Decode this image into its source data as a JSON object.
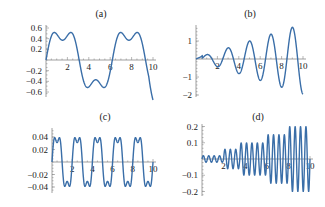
{
  "chart_data": [
    {
      "type": "line",
      "title": "(a)",
      "xlabel": "",
      "ylabel": "",
      "xlim": [
        0,
        10
      ],
      "ylim": [
        -0.7,
        0.7
      ],
      "xticks": [
        2,
        4,
        6,
        8,
        10
      ],
      "yticks": [
        0.6,
        0.4,
        0.2,
        -0.2,
        -0.4,
        -0.6
      ],
      "ytick_labels": [
        "0.6",
        "0.4",
        "0.2",
        "−0.2",
        "−0.4",
        "−0.6"
      ],
      "description": "Slow oscillation with shoulders; peaks ~0.7 at x~1.5 and x~7.7, trough ~-0.7 at x~4.7",
      "x": [
        0,
        0.5,
        1,
        1.5,
        2,
        2.5,
        3,
        3.5,
        4,
        4.5,
        5,
        5.5,
        6,
        6.5,
        7,
        7.5,
        8,
        8.5,
        9,
        9.5,
        10
      ],
      "values": [
        0,
        0.3,
        0.6,
        0.7,
        0.45,
        0.2,
        0.1,
        0.0,
        -0.35,
        -0.65,
        -0.65,
        -0.3,
        -0.15,
        -0.05,
        0.45,
        0.7,
        0.55,
        0.3,
        0.2,
        0.05,
        -0.35
      ],
      "grid": false
    },
    {
      "type": "line",
      "title": "(b)",
      "xlabel": "",
      "ylabel": "",
      "xlim": [
        0,
        10
      ],
      "ylim": [
        -2,
        1.7
      ],
      "xticks": [
        2,
        4,
        6,
        8,
        10
      ],
      "yticks": [
        1,
        -1,
        -2
      ],
      "ytick_labels": [
        "1",
        "−1",
        "−2"
      ],
      "description": "Growing oscillation; peaks ~0.2, 0.6, 1.0, 1.4, 1.7 at x~1,3,5,7,9; troughs ~-0.4, -0.8, -1.2, -1.6, -2.0 at x~2,4,6,8,10",
      "x": [
        0,
        1,
        2,
        3,
        4,
        5,
        6,
        7,
        8,
        9,
        10
      ],
      "values": [
        0,
        0.2,
        -0.4,
        0.6,
        -0.8,
        1.0,
        -1.2,
        1.4,
        -1.6,
        1.7,
        -2.0
      ],
      "grid": false
    },
    {
      "type": "line",
      "title": "(c)",
      "xlabel": "",
      "ylabel": "",
      "xlim": [
        0,
        10
      ],
      "ylim": [
        -0.05,
        0.05
      ],
      "xticks": [
        2,
        4,
        6,
        8,
        10
      ],
      "yticks": [
        0.04,
        0.02,
        -0.02,
        -0.04
      ],
      "ytick_labels": [
        "0.04",
        "0.02",
        "−0.02",
        "−0.04"
      ],
      "description": "Constant-amplitude periodic oscillation (period ~2) with flat shoulders near zero, amplitude ~0.05",
      "amplitude": 0.05,
      "period": 2.0,
      "grid": false
    },
    {
      "type": "line",
      "title": "(d)",
      "xlabel": "",
      "ylabel": "",
      "xlim": [
        0,
        10
      ],
      "ylim": [
        -0.22,
        0.22
      ],
      "xticks": [
        2,
        4,
        6,
        8,
        10
      ],
      "yticks": [
        0.2,
        0.1,
        -0.1,
        -0.2
      ],
      "ytick_labels": [
        "0.2",
        "0.1",
        "−0.1",
        "−0.2"
      ],
      "description": "Fast oscillation with stepwise growing envelope: ~0.02 (x<2), ~0.06 (2-3.5), ~0.1 (3.5-6), ~0.15 (6-8), ~0.2 (8-10)",
      "envelope_x": [
        0,
        2,
        3.5,
        6,
        8,
        10
      ],
      "envelope_y": [
        0.02,
        0.06,
        0.1,
        0.15,
        0.2,
        0.21
      ],
      "frequency_period": 0.5,
      "grid": false
    }
  ]
}
